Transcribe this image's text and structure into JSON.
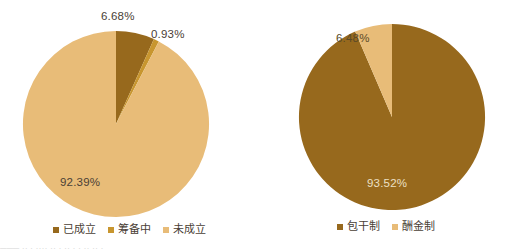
{
  "page": {
    "background": "#ffffff",
    "width": 513,
    "height": 249,
    "bottom_artifact_text": "───  ·· ·  ····  ·· ·  ·· ·  ·   ·· ·· ·"
  },
  "palette": {
    "dark_brown": "#97691d",
    "mid_gold": "#c8962f",
    "light_tan": "#e8bc78",
    "label_dark": "#4a4036",
    "label_light": "#ece0c5"
  },
  "charts": [
    {
      "id": "chart-left",
      "name": "establishment-status-pie",
      "type": "pie",
      "title": "",
      "legend_position": "bottom",
      "categories": [
        "已成立",
        "筹备中",
        "未成立"
      ],
      "values": [
        6.68,
        0.93,
        92.39
      ],
      "value_labels": [
        "6.68%",
        "0.93%",
        "92.39%"
      ],
      "colors": [
        "#97691d",
        "#c8962f",
        "#e8bc78"
      ],
      "label_colors": [
        "#4a4036",
        "#4a4036",
        "#4a4036"
      ]
    },
    {
      "id": "chart-right",
      "name": "fee-model-pie",
      "type": "pie",
      "title": "",
      "legend_position": "bottom",
      "categories": [
        "包干制",
        "酬金制"
      ],
      "values": [
        93.52,
        6.48
      ],
      "value_labels": [
        "93.52%",
        "6.48%"
      ],
      "colors": [
        "#97691d",
        "#e8bc78"
      ],
      "label_colors": [
        "#ece0c5",
        "#5a4a28"
      ]
    }
  ],
  "chart_data": [
    {
      "type": "pie",
      "title": "",
      "xlabel": "",
      "ylabel": "",
      "categories": [
        "已成立",
        "筹备中",
        "未成立"
      ],
      "values": [
        6.68,
        0.93,
        92.39
      ],
      "labels": [
        "6.68%",
        "0.93%",
        "92.39%"
      ],
      "colors": [
        "#97691d",
        "#c8962f",
        "#e8bc78"
      ],
      "legend": [
        "已成立",
        "筹备中",
        "未成立"
      ],
      "legend_position": "bottom",
      "start_angle_deg": 0,
      "direction": "clockwise",
      "grid": false
    },
    {
      "type": "pie",
      "title": "",
      "xlabel": "",
      "ylabel": "",
      "categories": [
        "包干制",
        "酬金制"
      ],
      "values": [
        93.52,
        6.48
      ],
      "labels": [
        "93.52%",
        "6.48%"
      ],
      "colors": [
        "#97691d",
        "#e8bc78"
      ],
      "legend": [
        "包干制",
        "酬金制"
      ],
      "legend_position": "bottom",
      "start_angle_deg": 0,
      "direction": "clockwise",
      "grid": false
    }
  ]
}
